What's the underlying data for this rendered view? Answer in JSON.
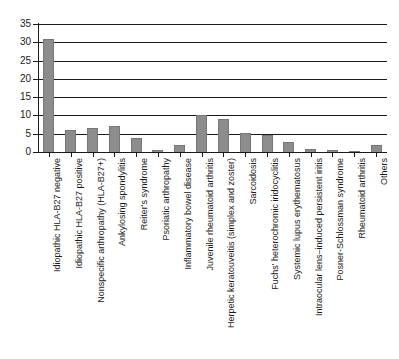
{
  "chart_data": {
    "type": "bar",
    "title": "",
    "xlabel": "",
    "ylabel": "",
    "ylim": [
      0,
      35
    ],
    "yticks": [
      0,
      5,
      10,
      15,
      20,
      25,
      30,
      35
    ],
    "grid": true,
    "legend": false,
    "bar_color": "#8c8c8c",
    "axis_color": "#1a1a1a",
    "categories": [
      "Idiopathic HLA-B27 negative",
      "Idiopathic HLA-B27 positive",
      "Nonspecific arthropathy (HLA-B27+)",
      "Ankylosing spondylitis",
      "Reiter's syndrome",
      "Psoriatic arthropathy",
      "Inflammatory bowel disease",
      "Juvenile rheumatoid arthritis",
      "Herpetic keratouveitis (simplex and zoster)",
      "Sarcoidosis",
      "Fuchs' heterochromic iridocyclitis",
      "Systemic lupus erythematosus",
      "Intraocular lens–induced persistent iritis",
      "Posner-Schlossman syndrome",
      "Rheumatoid arthritis",
      "Others"
    ],
    "values": [
      31.0,
      6.0,
      6.7,
      7.1,
      3.7,
      0.5,
      2.0,
      10.2,
      9.1,
      5.2,
      4.6,
      2.8,
      0.7,
      0.5,
      0.4,
      1.9
    ]
  },
  "axis": {
    "y_tick_labels": [
      "35",
      "30",
      "25",
      "20",
      "15",
      "10",
      "5",
      "0"
    ]
  }
}
